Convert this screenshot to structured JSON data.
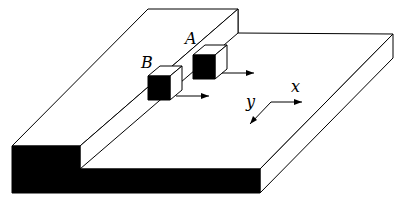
{
  "figure": {
    "labels": {
      "cube_a": "A",
      "cube_b": "B",
      "axis_x": "x",
      "axis_y": "y"
    },
    "colors": {
      "line": "#000000",
      "fill_front": "#000000",
      "fill_top": "#ffffff"
    }
  }
}
